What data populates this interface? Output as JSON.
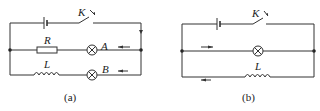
{
  "figure_a": {
    "caption": "(a)",
    "switch_label": "K",
    "resistor_label": "R",
    "inductor_label": "L",
    "lamp_a_label": "A",
    "lamp_b_label": "B"
  },
  "figure_b": {
    "caption": "(b)",
    "switch_label": "K",
    "inductor_label": "L"
  },
  "colors": {
    "line": "#333333",
    "background": "#ffffff"
  }
}
